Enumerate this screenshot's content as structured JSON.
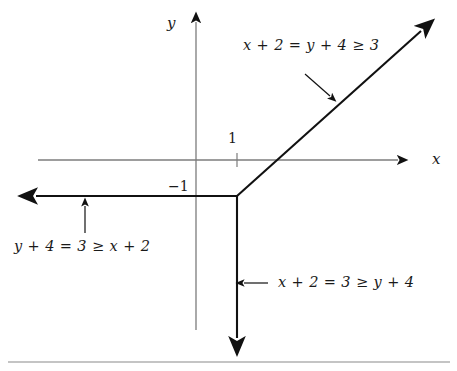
{
  "figure": {
    "type": "tropical-line-diagram",
    "background": "#ffffff",
    "axis_color": "#7c7c7c",
    "ray_color": "#111111",
    "rule_color": "#8a8a8a"
  },
  "axes": {
    "x_axis_label": "x",
    "y_axis_label": "y",
    "x_axis_y": 160,
    "y_axis_x": 196,
    "ticks": [
      {
        "label": "1",
        "axis": "x",
        "x": 237,
        "value": 1
      },
      {
        "label": "−1",
        "axis": "y",
        "y": 196,
        "value": -1
      }
    ]
  },
  "vertex": {
    "x": 237,
    "y": 196
  },
  "rays": [
    {
      "name": "upper-right-ray",
      "from": [
        237,
        196
      ],
      "to": [
        428,
        25
      ],
      "label": "x + 2 = y + 4 ≥ 3",
      "label_pos": [
        243,
        46
      ],
      "pointer": {
        "from": [
          305,
          74
        ],
        "to": [
          332,
          98
        ]
      }
    },
    {
      "name": "left-ray",
      "from": [
        237,
        196
      ],
      "to": [
        28,
        196
      ],
      "label": "y + 4 = 3 ≥ x + 2",
      "label_pos": [
        14,
        239
      ],
      "pointer": {
        "from": [
          85,
          233
        ],
        "to": [
          85,
          203
        ]
      }
    },
    {
      "name": "down-ray",
      "from": [
        237,
        196
      ],
      "to": [
        237,
        348
      ],
      "label": "x + 2 = 3 ≥ y + 4",
      "label_pos": [
        278,
        275
      ],
      "pointer": {
        "from": [
          268,
          283
        ],
        "to": [
          241,
          283
        ]
      }
    }
  ],
  "bottom_rule": {
    "y": 362,
    "x1": 8,
    "x2": 450
  }
}
